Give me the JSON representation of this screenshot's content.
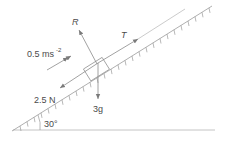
{
  "diagram": {
    "type": "inclined-plane-force-diagram",
    "labels": {
      "reaction": "R",
      "tension": "T",
      "acceleration_value": "0.5 ms",
      "acceleration_exp": "-2",
      "friction": "2.5 N",
      "weight": "3g",
      "angle": "30°"
    },
    "colors": {
      "line": "#9a9a9a",
      "text": "#4a4a4a",
      "background": "#ffffff"
    }
  }
}
